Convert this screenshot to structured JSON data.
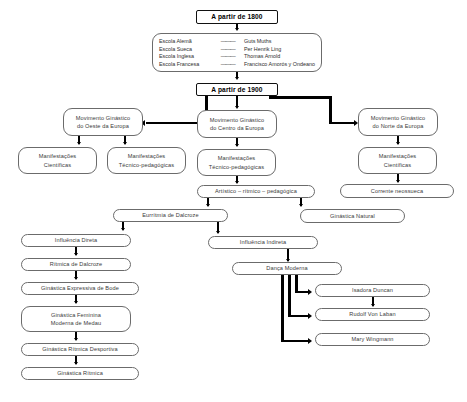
{
  "diagram": {
    "title_top": "A partir de 1800",
    "title_mid": "A partir de 1900",
    "schools": {
      "dash": "———",
      "rows": [
        {
          "school": "Escola Alemã",
          "person": "Guts Muths"
        },
        {
          "school": "Escola Sueca",
          "person": "Per Henrik Ling"
        },
        {
          "school": "Escola Inglesa",
          "person": "Thomas Arnold"
        },
        {
          "school": "Escola Francesa",
          "person": "Francisco Amorós y Ondeano"
        }
      ]
    },
    "nodes": {
      "mov_oeste_l1": "Movimento Ginástico",
      "mov_oeste_l2": "do Oeste da Europa",
      "mov_centro_l1": "Movimento Ginástico",
      "mov_centro_l2": "do Centro da Europa",
      "mov_norte_l1": "Movimento Ginástico",
      "mov_norte_l2": "do Norte da Europa",
      "manif_cient_oeste_l1": "Manifestações",
      "manif_cient_oeste_l2": "Científicas",
      "manif_tecno_oeste_l1": "Manifestações",
      "manif_tecno_oeste_l2": "Técnico-pedagógicas",
      "manif_tecno_centro_l1": "Manifestações",
      "manif_tecno_centro_l2": "Técnico-pedagógicas",
      "manif_cient_norte_l1": "Manifestações",
      "manif_cient_norte_l2": "Científicas",
      "artistico": "Artístico – rítmico – pedagógica",
      "corrente": "Corrente neossueca",
      "euritmia": "Eurrítmia de Dalcroze",
      "ginastica_natural": "Ginástica Natural",
      "influencia_direta": "Influência Direta",
      "influencia_indireta": "Influência Indireta",
      "ritmica_dalcroze": "Rítmica de Dalcroze",
      "danca_moderna": "Dança Moderna",
      "ginastica_bode": "Ginástica Expressiva de Bode",
      "isadora": "Isadora Duncan",
      "medau_l1": "Ginástica Feminina",
      "medau_l2": "Moderna de Medau",
      "laban": "Rudolf Von Laban",
      "grd": "Ginástica Rítmica Desportiva",
      "wingmann": "Mary Wingmann",
      "ginastica_ritmica": "Ginástica Rítmica"
    }
  }
}
